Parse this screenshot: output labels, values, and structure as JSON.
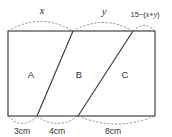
{
  "figure": {
    "background_color": "#ffffff",
    "line_color": "#3a3a3a",
    "arc_color": "#7a7a7a"
  },
  "regions": [
    {
      "id": "A",
      "label": "A"
    },
    {
      "id": "B",
      "label": "B"
    },
    {
      "id": "C",
      "label": "C"
    }
  ],
  "top_labels": [
    {
      "id": "x",
      "label": "x",
      "style": "italic"
    },
    {
      "id": "y",
      "label": "y",
      "style": "italic"
    },
    {
      "id": "remainder",
      "label": "15-(x+y)",
      "parts": {
        "prefix": "15",
        "minus": "−",
        "open": "(",
        "v1": "x",
        "plus": "+",
        "v2": "y",
        "close": ")"
      }
    }
  ],
  "bottom_labels": [
    {
      "id": "seg-a",
      "label": "3cm",
      "value": 3,
      "unit": "cm"
    },
    {
      "id": "seg-b",
      "label": "4cm",
      "value": 4,
      "unit": "cm"
    },
    {
      "id": "seg-c",
      "label": "8cm",
      "value": 8,
      "unit": "cm"
    }
  ],
  "geometry": {
    "rect": {
      "left": 8,
      "top": 31,
      "right": 155,
      "bottom": 116
    },
    "top_dividers": [
      73,
      133
    ],
    "bottom_dividers": [
      37,
      78
    ]
  }
}
